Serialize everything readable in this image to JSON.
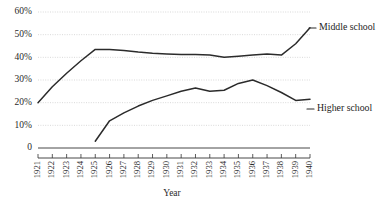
{
  "chart_data": {
    "type": "line",
    "title": "",
    "xlabel": "Year",
    "ylabel": "",
    "grid": true,
    "legend_position": "right-inline-labels",
    "ylim": [
      0,
      60
    ],
    "ytick_values": [
      0,
      10,
      20,
      30,
      40,
      50,
      60
    ],
    "ytick_labels": [
      "0",
      "10%",
      "20%",
      "30%",
      "40%",
      "50%",
      "60%"
    ],
    "x": [
      1921,
      1922,
      1923,
      1924,
      1925,
      1926,
      1927,
      1928,
      1929,
      1930,
      1931,
      1932,
      1933,
      1934,
      1935,
      1936,
      1937,
      1938,
      1939,
      1940
    ],
    "categories": [
      "1921",
      "1922",
      "1923",
      "1924",
      "1925",
      "1926",
      "1927",
      "1928",
      "1929",
      "1930",
      "1931",
      "1932",
      "1933",
      "1934",
      "1935",
      "1936",
      "1937",
      "1938",
      "1939",
      "1940"
    ],
    "series": [
      {
        "name": "Middle school",
        "label": "Middle school",
        "color": "#2b2b2b",
        "x": [
          1921,
          1922,
          1923,
          1924,
          1925,
          1926,
          1927,
          1928,
          1929,
          1930,
          1931,
          1932,
          1933,
          1934,
          1935,
          1936,
          1937,
          1938,
          1939,
          1940
        ],
        "values": [
          20.0,
          27.0,
          33.0,
          38.5,
          43.5,
          43.5,
          43.0,
          42.3,
          41.8,
          41.5,
          41.3,
          41.2,
          41.0,
          40.0,
          40.5,
          41.0,
          41.5,
          41.0,
          46.0,
          53.0
        ]
      },
      {
        "name": "Higher school",
        "label": "Higher school",
        "color": "#2b2b2b",
        "x": [
          1925,
          1926,
          1927,
          1928,
          1929,
          1930,
          1931,
          1932,
          1933,
          1934,
          1935,
          1936,
          1937,
          1938,
          1939,
          1940
        ],
        "values": [
          3.0,
          12.0,
          15.5,
          18.5,
          21.0,
          23.0,
          25.0,
          26.5,
          25.0,
          25.5,
          28.5,
          30.0,
          27.5,
          24.5,
          21.0,
          21.5
        ]
      }
    ]
  },
  "labels": {
    "middle_school": "Middle school",
    "higher_school": "Higher school",
    "x_axis_title": "Year"
  }
}
